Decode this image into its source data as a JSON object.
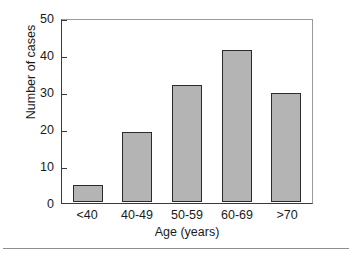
{
  "chart_data": {
    "type": "bar",
    "title": "",
    "xlabel": "Age (years)",
    "ylabel": "Number of cases",
    "categories": [
      "<40",
      "40-49",
      "50-59",
      "60-69",
      ">70"
    ],
    "values": [
      4.5,
      19,
      31.5,
      41,
      29.5
    ],
    "ylim": [
      0,
      50
    ],
    "yticks": [
      0,
      10,
      20,
      30,
      40,
      50
    ],
    "ytick_labels": [
      "0",
      "10",
      "20",
      "30",
      "40",
      "50"
    ],
    "grid": false,
    "legend": null,
    "series": [
      {
        "name": "Number of cases",
        "values": [
          4.5,
          19,
          31.5,
          41,
          29.5
        ]
      }
    ],
    "colors": {
      "bar_fill": "#b4b4b4",
      "bar_edge": "#2b2b2b",
      "axis": "#3a3a3a",
      "frame": "#9a9a9a",
      "background": "#ffffff",
      "text": "#1a1a1a"
    }
  }
}
